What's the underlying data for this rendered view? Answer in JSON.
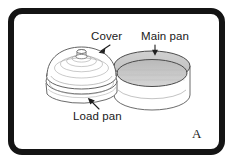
{
  "figure": {
    "panel_letter": "A",
    "type": "technical-line-drawing",
    "background_color": "#ffffff",
    "frame_color": "#141414",
    "line_color": "#5a5a5a",
    "shade_color": "#c8c8c8"
  },
  "labels": {
    "cover": "Cover",
    "main_pan": "Main pan",
    "load_pan": "Load pan"
  },
  "parts": [
    {
      "name": "cover",
      "description": "domed lid with concentric ribs and a central knob, seated on the load pan",
      "label": "Cover"
    },
    {
      "name": "load_pan",
      "description": "shallow dish beneath the domed cover",
      "label": "Load pan"
    },
    {
      "name": "main_pan",
      "description": "open cylindrical pan with shaded interior floor",
      "label": "Main pan"
    }
  ],
  "callout_arrows": [
    {
      "from": "cover",
      "direction": "down-left"
    },
    {
      "from": "main_pan",
      "direction": "down"
    },
    {
      "from": "load_pan",
      "direction": "up-right"
    }
  ]
}
